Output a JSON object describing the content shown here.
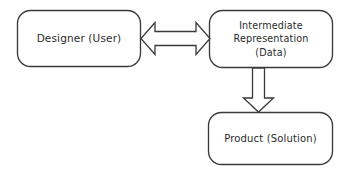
{
  "diagram": {
    "background_color": "#ffffff",
    "stroke_color": "#3a3a3a",
    "text_color": "#2b2b2b",
    "nodes": [
      {
        "id": "designer",
        "name": "designer-user-node",
        "shape": "rounded-rectangle",
        "lines": [
          "Designer (User)"
        ],
        "text": "Designer (User)"
      },
      {
        "id": "intermediate",
        "name": "intermediate-representation-node",
        "shape": "rounded-rectangle",
        "lines": [
          "Intermediate",
          "Representation",
          "(Data)"
        ],
        "text": "Intermediate Representation (Data)"
      },
      {
        "id": "product",
        "name": "product-solution-node",
        "shape": "rounded-rectangle",
        "lines": [
          "Product (Solution)"
        ],
        "text": "Product (Solution)"
      }
    ],
    "connectors": [
      {
        "id": "designer-intermediate",
        "name": "bidirectional-arrow",
        "style": "hollow-block-double-arrow",
        "direction": "bidirectional",
        "from": "designer",
        "to": "intermediate",
        "label": ""
      },
      {
        "id": "intermediate-product",
        "name": "down-arrow",
        "style": "hollow-block-arrow",
        "direction": "down",
        "from": "intermediate",
        "to": "product",
        "label": ""
      }
    ]
  }
}
